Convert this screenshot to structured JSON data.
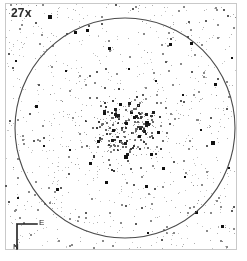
{
  "view": {
    "background_color": "#ffffff",
    "frame_color": "#c9c9c9",
    "width": 247,
    "height": 261
  },
  "magnification": {
    "label": "27x",
    "value": 27,
    "unit": "x"
  },
  "field_of_view": {
    "shape": "circle",
    "center_x": 125,
    "center_y": 128,
    "radius": 110,
    "stroke_color": "#4a4a4a",
    "stroke_width": 1.1
  },
  "compass": {
    "name": "orientation-indicator",
    "east_label": "E",
    "north_label": "N",
    "line_color": "#1e1e1e"
  },
  "chart_data": {
    "type": "scatter",
    "title": "27x",
    "xlabel": "",
    "ylabel": "",
    "xlim": [
      0,
      247
    ],
    "ylim": [
      0,
      261
    ],
    "grid": false,
    "legend": null,
    "annotations": [
      "27x",
      "E",
      "N"
    ],
    "series": [
      {
        "name": "bright-stars",
        "marker": "square",
        "color": "#111111",
        "points": [
          [
            50,
            17,
            4.0
          ],
          [
            213,
            143,
            4.0
          ],
          [
            88,
            31,
            3.4
          ],
          [
            110,
            49,
            3.4
          ],
          [
            126,
            157,
            3.6
          ],
          [
            152,
            155,
            3.2
          ],
          [
            140,
            137,
            3.4
          ],
          [
            127,
            124,
            3.2
          ],
          [
            75,
            32,
            3.0
          ],
          [
            170,
            44,
            3.0
          ],
          [
            191,
            43,
            2.8
          ],
          [
            215,
            84,
            2.8
          ],
          [
            36,
            106,
            2.6
          ],
          [
            57,
            189,
            2.8
          ],
          [
            196,
            212,
            3.0
          ],
          [
            222,
            226,
            2.8
          ],
          [
            106,
            182,
            2.6
          ],
          [
            146,
            186,
            2.8
          ],
          [
            163,
            168,
            2.6
          ],
          [
            98,
            141,
            3.0
          ],
          [
            113,
            130,
            2.8
          ],
          [
            134,
            117,
            2.8
          ],
          [
            120,
            104,
            2.6
          ],
          [
            104,
            113,
            2.6
          ],
          [
            147,
            122,
            2.6
          ],
          [
            158,
            132,
            2.6
          ],
          [
            90,
            163,
            2.6
          ],
          [
            70,
            150,
            2.4
          ],
          [
            183,
            95,
            2.4
          ],
          [
            201,
            130,
            2.4
          ],
          [
            44,
            146,
            2.4
          ],
          [
            66,
            71,
            2.4
          ],
          [
            129,
            69,
            2.4
          ],
          [
            156,
            81,
            2.4
          ],
          [
            185,
            177,
            2.4
          ],
          [
            229,
            168,
            2.4
          ],
          [
            16,
            61,
            2.2
          ],
          [
            232,
            58,
            2.2
          ],
          [
            18,
            198,
            2.2
          ],
          [
            148,
            233,
            2.2
          ]
        ]
      },
      {
        "name": "cluster-core-stars",
        "marker": "square",
        "color": "#3a3a3a",
        "center": [
          126,
          130
        ],
        "core_radius": 42,
        "count": 230
      },
      {
        "name": "field-stars",
        "marker": "square",
        "color": "#8a8a8a",
        "count": 520
      },
      {
        "name": "faint-background-stars",
        "marker": "dot",
        "color": "#c4c4c4",
        "count": 420
      }
    ]
  }
}
